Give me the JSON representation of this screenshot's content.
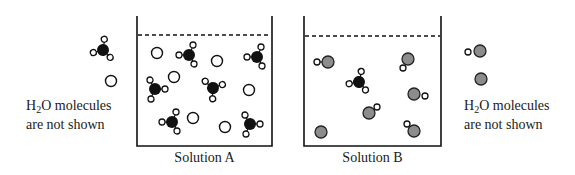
{
  "left_legend": {
    "line1_prefix": "H",
    "line1_sub": "2",
    "line1_suffix": "O molecules",
    "line2": "are not shown"
  },
  "right_legend": {
    "line1_prefix": "H",
    "line1_sub": "2",
    "line1_suffix": "O molecules",
    "line2": "are not shown"
  },
  "containers": [
    {
      "label": "Solution A"
    },
    {
      "label": "Solution B"
    }
  ],
  "colors": {
    "black_particle": "#111111",
    "grey_particle": "#8c8c8c",
    "outline": "#1a1a1a",
    "background": "#ffffff"
  },
  "particle_types": {
    "black_with_3_small": "black central atom bonded to three small open circles",
    "open_circle": "open (white) circle ion",
    "grey_with_1_small": "grey atom bonded to one small open circle",
    "grey_circle": "grey circle ion"
  }
}
